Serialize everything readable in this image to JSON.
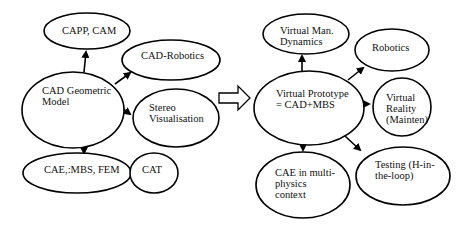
{
  "diagram": {
    "left_group": {
      "nodes": [
        {
          "id": "cad_geometric_model",
          "label": "CAD Geometric\nModel"
        },
        {
          "id": "capp_cam",
          "label": "CAPP, CAM"
        },
        {
          "id": "cad_robotics",
          "label": "CAD-Robotics"
        },
        {
          "id": "stereo_visualisation",
          "label": "Stereo\nVisualisation"
        },
        {
          "id": "cae_mbs_fem",
          "label": "CAE,:MBS, FEM"
        },
        {
          "id": "cat",
          "label": "CAT"
        }
      ],
      "edges": [
        {
          "from": "cad_geometric_model",
          "to": "capp_cam"
        },
        {
          "from": "cad_geometric_model",
          "to": "cad_robotics"
        },
        {
          "from": "cad_geometric_model",
          "to": "stereo_visualisation"
        },
        {
          "from": "cad_geometric_model",
          "to": "cae_mbs_fem"
        }
      ]
    },
    "transition_arrow": {
      "icon": "hollow-right-arrow-icon"
    },
    "right_group": {
      "nodes": [
        {
          "id": "virtual_prototype",
          "label": "Virtual Prototype\n= CAD+MBS"
        },
        {
          "id": "virtual_man_dynamics",
          "label": "Virtual Man.\nDynamics"
        },
        {
          "id": "robotics",
          "label": "Robotics"
        },
        {
          "id": "virtual_reality",
          "label": "Virtual\nReality\n(Mainten)"
        },
        {
          "id": "testing_hil",
          "label": "Testing (H-in-\nthe-loop)"
        },
        {
          "id": "cae_multiphysics",
          "label": "CAE in multi-\nphysics\ncontext"
        }
      ],
      "edges": [
        {
          "from": "virtual_prototype",
          "to": "virtual_man_dynamics"
        },
        {
          "from": "virtual_prototype",
          "to": "robotics"
        },
        {
          "from": "virtual_prototype",
          "to": "virtual_reality"
        },
        {
          "from": "virtual_prototype",
          "to": "testing_hil"
        },
        {
          "from": "virtual_prototype",
          "to": "cae_multiphysics"
        }
      ]
    },
    "colors": {
      "stroke": "#000000",
      "fill": "#ffffff",
      "text": "#111111"
    }
  }
}
